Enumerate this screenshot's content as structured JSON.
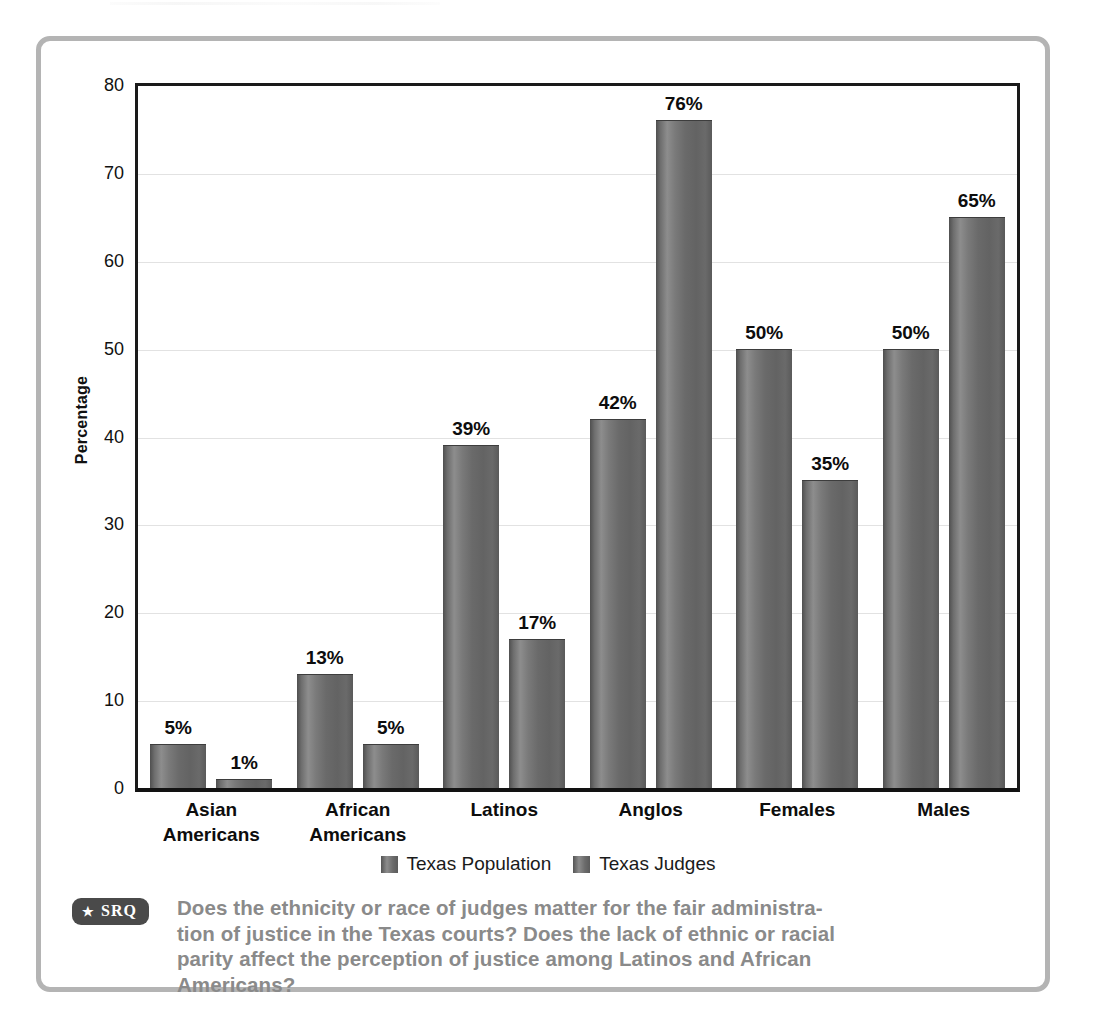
{
  "chart_data": {
    "type": "bar",
    "title": "",
    "subtitle": "",
    "xlabel": "",
    "ylabel": "Percentage",
    "ylim": [
      0,
      80
    ],
    "ytick_labels": [
      "80",
      "70",
      "60",
      "50",
      "40",
      "30",
      "20",
      "10",
      "0"
    ],
    "ytick_values": [
      80,
      70,
      60,
      50,
      40,
      30,
      20,
      10,
      0
    ],
    "grid": true,
    "grid_axis": "y",
    "legend_position": "bottom-center",
    "categories": [
      "Asian Americans",
      "African Americans",
      "Latinos",
      "Anglos",
      "Females",
      "Males"
    ],
    "category_lines": [
      [
        "Asian",
        "Americans"
      ],
      [
        "African",
        "Americans"
      ],
      [
        "Latinos"
      ],
      [
        "Anglos"
      ],
      [
        "Females"
      ],
      [
        "Males"
      ]
    ],
    "series": [
      {
        "name": "Texas Population",
        "values": [
          5,
          13,
          39,
          42,
          50,
          50
        ],
        "labels": [
          "5%",
          "13%",
          "39%",
          "42%",
          "50%",
          "50%"
        ]
      },
      {
        "name": "Texas Judges",
        "values": [
          1,
          5,
          17,
          76,
          35,
          65
        ],
        "labels": [
          "1%",
          "5%",
          "17%",
          "76%",
          "35%",
          "65%"
        ]
      }
    ],
    "colors": {
      "bar_dark": "#555555",
      "bar_light": "#8d8d8d",
      "axis": "#1a1a1a",
      "gridline": "#e2e2e2",
      "frame": "#b4b4b4",
      "question_text": "#8a8a8a",
      "badge_background": "#4a4a4a"
    }
  },
  "legend": {
    "items": [
      {
        "label": "Texas Population",
        "swatch": "bar-swatch-icon"
      },
      {
        "label": "Texas Judges",
        "swatch": "bar-swatch-icon"
      }
    ]
  },
  "srq": {
    "badge_star": "★",
    "badge_label": "SRQ",
    "question_lines": [
      "Does the ethnicity or race of judges matter for the fair administra-",
      "tion of justice in the Texas courts? Does the lack of ethnic or racial",
      "parity affect the perception of justice among Latinos and African",
      "Americans?"
    ]
  }
}
